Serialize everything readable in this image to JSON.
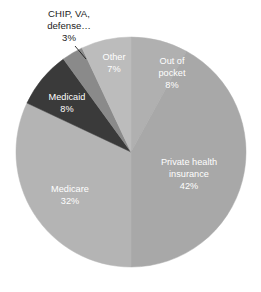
{
  "chart_data": {
    "type": "pie",
    "title": "",
    "subtitle": "",
    "xlabel": "",
    "ylabel": "",
    "legend_position": "none",
    "grid": false,
    "value_suffix": "%",
    "categories": [
      "Out of pocket",
      "Private health insurance",
      "Medicare",
      "Medicaid",
      "CHIP, VA, defense…",
      "Other"
    ],
    "values": [
      8,
      42,
      32,
      8,
      3,
      7
    ],
    "colors": [
      "#b0b0b0",
      "#a8a8a8",
      "#b4b4b4",
      "#3a3a3a",
      "#8a8a8a",
      "#bcbcbc"
    ],
    "slices": [
      {
        "name": "out-of-pocket",
        "label_line1": "Out of",
        "label_line2": "pocket",
        "value_label": "8%",
        "value": 8,
        "color": "#b0b0b0",
        "label_placement": "inside",
        "label_color": "#ffffff"
      },
      {
        "name": "private-health-insurance",
        "label_line1": "Private health",
        "label_line2": "insurance",
        "value_label": "42%",
        "value": 42,
        "color": "#a8a8a8",
        "label_placement": "inside",
        "label_color": "#ffffff"
      },
      {
        "name": "medicare",
        "label_line1": "Medicare",
        "label_line2": "",
        "value_label": "32%",
        "value": 32,
        "color": "#b4b4b4",
        "label_placement": "inside",
        "label_color": "#ffffff"
      },
      {
        "name": "medicaid",
        "label_line1": "Medicaid",
        "label_line2": "",
        "value_label": "8%",
        "value": 8,
        "color": "#3a3a3a",
        "label_placement": "inside",
        "label_color": "#ffffff"
      },
      {
        "name": "chip-va-defense",
        "label_line1": "CHIP, VA,",
        "label_line2": "defense…",
        "value_label": "3%",
        "value": 3,
        "color": "#8a8a8a",
        "label_placement": "outside",
        "label_color": "#1c1c1c"
      },
      {
        "name": "other",
        "label_line1": "Other",
        "label_line2": "",
        "value_label": "7%",
        "value": 7,
        "color": "#bcbcbc",
        "label_placement": "inside",
        "label_color": "#ffffff"
      }
    ],
    "geometry": {
      "center_x": 131,
      "center_y": 152,
      "radius": 115,
      "start_angle_deg": -90,
      "direction": "clockwise"
    },
    "label_positions": {
      "out_of_pocket": {
        "x": 172,
        "y": 62,
        "line_gap": 12
      },
      "private_health": {
        "x": 189,
        "y": 163,
        "line_gap": 12
      },
      "medicare": {
        "x": 70,
        "y": 190,
        "line_gap": 12
      },
      "medicaid": {
        "x": 67,
        "y": 98,
        "line_gap": 12
      },
      "chip_va_defense": {
        "x": 69,
        "y": 14,
        "line_gap": 12
      },
      "other": {
        "x": 114,
        "y": 58,
        "line_gap": 12
      }
    },
    "leader_line": {
      "x1": 75,
      "y1": 46,
      "x2": 86,
      "y2": 59
    }
  }
}
